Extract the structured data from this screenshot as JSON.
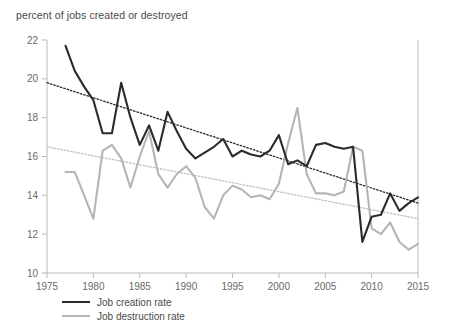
{
  "chart_data": {
    "type": "line",
    "title": "percent of jobs created or destroyed",
    "xlabel": "",
    "ylabel": "percent of jobs created or destroyed",
    "xlim": [
      1975,
      2015
    ],
    "ylim": [
      10,
      22
    ],
    "xticks": [
      1975,
      1980,
      1985,
      1990,
      1995,
      2000,
      2005,
      2010,
      2015
    ],
    "yticks": [
      10,
      12,
      14,
      16,
      18,
      20,
      22
    ],
    "grid": false,
    "legend_position": "bottom-left",
    "x": [
      1977,
      1978,
      1979,
      1980,
      1981,
      1982,
      1983,
      1984,
      1985,
      1986,
      1987,
      1988,
      1989,
      1990,
      1991,
      1992,
      1993,
      1994,
      1995,
      1996,
      1997,
      1998,
      1999,
      2000,
      2001,
      2002,
      2003,
      2004,
      2005,
      2006,
      2007,
      2008,
      2009,
      2010,
      2011,
      2012,
      2013,
      2014,
      2015
    ],
    "series": [
      {
        "name": "Job creation rate",
        "color": "#2b2b2b",
        "values": [
          21.7,
          20.4,
          19.6,
          18.9,
          17.2,
          17.2,
          19.8,
          18.0,
          16.6,
          17.6,
          16.3,
          18.3,
          17.3,
          16.4,
          15.9,
          16.2,
          16.5,
          16.9,
          16.0,
          16.3,
          16.1,
          16.0,
          16.3,
          17.1,
          15.6,
          15.8,
          15.5,
          16.6,
          16.7,
          16.5,
          16.4,
          16.5,
          11.6,
          12.9,
          13.0,
          14.1,
          13.2,
          13.6,
          13.9
        ]
      },
      {
        "name": "Job destruction rate",
        "color": "#b5b5b5",
        "values": [
          15.2,
          15.2,
          14.0,
          12.8,
          16.3,
          16.6,
          15.9,
          14.4,
          16.0,
          17.3,
          15.1,
          14.4,
          15.1,
          15.5,
          14.9,
          13.4,
          12.8,
          14.0,
          14.5,
          14.3,
          13.9,
          14.0,
          13.8,
          14.6,
          16.7,
          18.5,
          15.1,
          14.1,
          14.1,
          14.0,
          14.2,
          16.5,
          16.3,
          12.3,
          12.0,
          12.6,
          11.6,
          11.2,
          11.5
        ]
      }
    ],
    "trendlines": [
      {
        "name": "Job creation rate trend",
        "color": "#2b2b2b",
        "style": "dotted",
        "x": [
          1975,
          2015
        ],
        "y": [
          19.8,
          13.6
        ]
      },
      {
        "name": "Job destruction rate trend",
        "color": "#c2c2c2",
        "style": "dotted",
        "x": [
          1975,
          2015
        ],
        "y": [
          16.5,
          12.8
        ]
      }
    ]
  },
  "legend": {
    "items": [
      {
        "label": "Job creation rate"
      },
      {
        "label": "Job destruction rate"
      }
    ]
  }
}
